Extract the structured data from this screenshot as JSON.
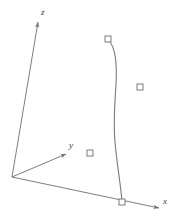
{
  "figure": {
    "kind": "3d-coordinate-axes-with-curve",
    "width": 176,
    "height": 224,
    "background_color": "#ffffff",
    "line_color": "#6e6e6e",
    "curve_color": "#7a7a7a",
    "marker_color": "#6e6e6e",
    "label_color": "#3a3a3a"
  },
  "axes": {
    "origin": {
      "x": 12,
      "y": 177
    },
    "items": [
      {
        "name": "z",
        "label": "z",
        "label_x": 41,
        "label_y": 8,
        "from": {
          "x": 12,
          "y": 177
        },
        "to": {
          "x": 38,
          "y": 22
        }
      },
      {
        "name": "y",
        "label": "y",
        "label_x": 69,
        "label_y": 141,
        "from": {
          "x": 12,
          "y": 177
        },
        "to": {
          "x": 66,
          "y": 154
        }
      },
      {
        "name": "x",
        "label": "x",
        "label_x": 163,
        "label_y": 197,
        "from": {
          "x": 12,
          "y": 177
        },
        "to": {
          "x": 159,
          "y": 208
        }
      }
    ]
  },
  "curve": {
    "name": "s-curve",
    "start": {
      "x": 108,
      "y": 39
    },
    "end": {
      "x": 122,
      "y": 202
    },
    "path": "M 108 39 C 116 48, 117 64, 116 84 C 115 104, 113 120, 115 142 C 117 166, 121 186, 122 202"
  },
  "markers": [
    {
      "name": "marker-curve-top",
      "x": 108,
      "y": 39,
      "size": 6,
      "on_curve": true
    },
    {
      "name": "marker-right",
      "x": 140,
      "y": 87,
      "size": 6,
      "on_curve": false
    },
    {
      "name": "marker-middle",
      "x": 90,
      "y": 153,
      "size": 6,
      "on_curve": false
    },
    {
      "name": "marker-curve-bottom",
      "x": 122,
      "y": 202,
      "size": 6,
      "on_curve": true
    }
  ],
  "chart_data": {
    "type": "scatter",
    "title": "",
    "xlabel": "x",
    "ylabel": "y",
    "zlabel": "z",
    "grid": false,
    "legend": null,
    "annotations": [],
    "series": [
      {
        "name": "curve",
        "kind": "line",
        "points_px": [
          [
            108,
            39
          ],
          [
            116,
            60
          ],
          [
            116,
            84
          ],
          [
            114,
            110
          ],
          [
            115,
            142
          ],
          [
            119,
            175
          ],
          [
            122,
            202
          ]
        ]
      },
      {
        "name": "square-markers",
        "kind": "scatter",
        "marker": "open-square",
        "points_px": [
          [
            108,
            39
          ],
          [
            140,
            87
          ],
          [
            90,
            153
          ],
          [
            122,
            202
          ]
        ]
      }
    ]
  }
}
